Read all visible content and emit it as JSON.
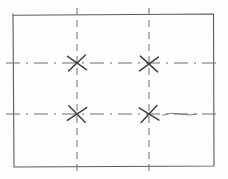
{
  "document": {
    "title": "Hand-drawn rectangular plate layout sketch",
    "kind": "engineering-sketch",
    "canvas": {
      "width": 228,
      "height": 179
    },
    "background_color": "#fdfdfb",
    "ink_color": "#5b5b5b",
    "ink_color_light": "#7a7a7a"
  },
  "outline": {
    "name": "plate-outline",
    "shape": "rectangle",
    "stroke": "#5b5b5b",
    "stroke_width": 1.1,
    "left": 13,
    "top": 14,
    "right": 214,
    "bottom": 167,
    "width": 201,
    "height": 153
  },
  "centerlines": {
    "vertical": [
      {
        "name": "vertical-centerline-left",
        "x": 77,
        "y_start": 8,
        "y_end": 173,
        "style": "dashed",
        "dash_pattern": "7 5",
        "stroke": "#6e6e6e",
        "stroke_width": 1
      },
      {
        "name": "vertical-centerline-right",
        "x": 149,
        "y_start": 8,
        "y_end": 173,
        "style": "dashed",
        "dash_pattern": "7 5",
        "stroke": "#6e6e6e",
        "stroke_width": 1
      }
    ],
    "horizontal": [
      {
        "name": "horizontal-centerline-upper",
        "y": 63,
        "x_start": 6,
        "x_end": 222,
        "style": "dash-dot",
        "dash_pattern": "14 6 2 6",
        "stroke": "#6e6e6e",
        "stroke_width": 1
      },
      {
        "name": "horizontal-centerline-lower",
        "y": 114,
        "x_start": 6,
        "x_end": 222,
        "style": "dash-dot",
        "dash_pattern": "14 6 2 6",
        "stroke": "#6e6e6e",
        "stroke_width": 1
      }
    ]
  },
  "markers": [
    {
      "name": "cross-marker-top-left",
      "label": "X",
      "cx": 77,
      "cy": 63,
      "arm": 9,
      "rotation": -4,
      "stroke": "#3f3f3f",
      "stroke_width": 1.5
    },
    {
      "name": "cross-marker-top-right",
      "label": "X",
      "cx": 149,
      "cy": 64,
      "arm": 9,
      "rotation": 3,
      "stroke": "#3f3f3f",
      "stroke_width": 1.5
    },
    {
      "name": "cross-marker-bottom-left",
      "label": "X",
      "cx": 77,
      "cy": 114,
      "arm": 9,
      "rotation": 6,
      "stroke": "#3f3f3f",
      "stroke_width": 1.5
    },
    {
      "name": "cross-marker-bottom-right",
      "label": "X",
      "cx": 149,
      "cy": 114,
      "arm": 9,
      "rotation": -8,
      "stroke": "#3f3f3f",
      "stroke_width": 1.5
    }
  ],
  "freehand": {
    "name": "wavy-line-segment",
    "description": "irregular hand-drawn stroke on lower centerline right of second cross",
    "path": "M 163 115 Q 172 112 181 114 Q 190 116 197 114",
    "stroke": "#7a7a7a",
    "stroke_width": 1
  },
  "counts": {
    "markers": 4,
    "vertical_centerlines": 2,
    "horizontal_centerlines": 2
  }
}
